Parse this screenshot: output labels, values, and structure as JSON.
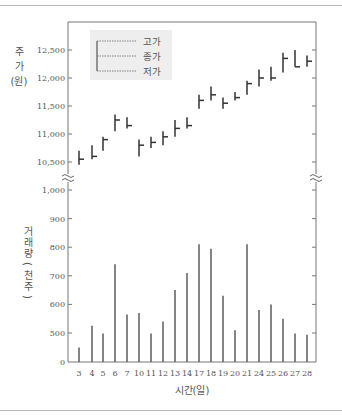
{
  "chart_data": {
    "type": "bar",
    "subtype": "high-low-close price chart with volume bars",
    "title": "",
    "xlabel": "시간(일)",
    "categories": [
      "3",
      "4",
      "5",
      "6",
      "7",
      "10",
      "11",
      "12",
      "13",
      "14",
      "17",
      "18",
      "19",
      "20",
      "21",
      "24",
      "25",
      "26",
      "27",
      "28"
    ],
    "price_axis": {
      "label_chars": [
        "주",
        "가",
        "(원)"
      ],
      "ticks": [
        "12,500",
        "12,000",
        "11,500",
        "11,000",
        "10,500"
      ],
      "ylim": [
        10500,
        12900
      ]
    },
    "volume_axis": {
      "label": "거래량(천주)",
      "ticks": [
        "1,000",
        "900",
        "800",
        "700",
        "600",
        "500",
        "0"
      ],
      "ylim": [
        0,
        1000
      ],
      "note": "axis broken between 0 and 500"
    },
    "legend": {
      "position": "upper-left",
      "items": [
        "고가",
        "종가",
        "저가"
      ]
    },
    "series": [
      {
        "name": "고가",
        "values": [
          10700,
          10800,
          10950,
          11350,
          11300,
          10900,
          10950,
          11050,
          11250,
          11300,
          11700,
          11850,
          11650,
          11750,
          11950,
          12150,
          12200,
          12450,
          12500,
          12400
        ]
      },
      {
        "name": "저가",
        "values": [
          10450,
          10550,
          10700,
          11050,
          11100,
          10600,
          10750,
          10800,
          10950,
          11100,
          11450,
          11600,
          11450,
          11600,
          11700,
          11850,
          11950,
          12100,
          12200,
          12200
        ]
      },
      {
        "name": "종가",
        "values": [
          10550,
          10600,
          10900,
          11250,
          11150,
          10800,
          10850,
          10950,
          11100,
          11150,
          11600,
          11700,
          11550,
          11650,
          11900,
          12000,
          12000,
          12350,
          12200,
          12300
        ]
      },
      {
        "name": "거래량(천주)",
        "values": [
          250,
          525,
          490,
          740,
          565,
          570,
          490,
          540,
          650,
          710,
          810,
          795,
          630,
          510,
          810,
          580,
          600,
          550,
          490,
          470
        ]
      }
    ],
    "grid": false,
    "break_marks": "≈"
  }
}
